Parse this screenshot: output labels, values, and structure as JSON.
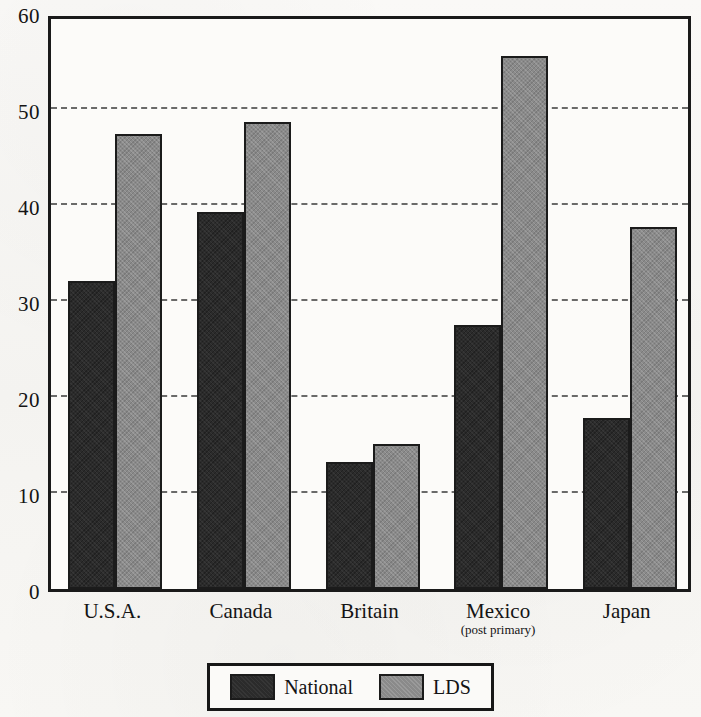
{
  "chart_data": {
    "type": "bar",
    "title": "",
    "subtitle": "",
    "xlabel": "",
    "ylabel": "",
    "categories": [
      "U.S.A.",
      "Canada",
      "Britain",
      "Mexico",
      "Japan"
    ],
    "category_sublabels": [
      "",
      "",
      "",
      "(post primary)",
      ""
    ],
    "series": [
      {
        "name": "National",
        "values": [
          32.1,
          39.3,
          13.2,
          27.5,
          17.8
        ],
        "color": "#2b2b2b"
      },
      {
        "name": "LDS",
        "values": [
          47.4,
          48.6,
          15.1,
          55.5,
          37.7
        ],
        "color": "#8a8a8a"
      }
    ],
    "ylim": [
      0,
      60
    ],
    "ytick_values": [
      0,
      10,
      20,
      30,
      40,
      50,
      60
    ],
    "ytick_labels": [
      "0",
      "10",
      "20",
      "30",
      "40",
      "50",
      "60"
    ],
    "grid": true,
    "grid_axis": "y",
    "legend_position": "bottom-center",
    "frame": true
  },
  "legend": {
    "entries": [
      {
        "label": "National",
        "swatch": "national"
      },
      {
        "label": "LDS",
        "swatch": "lds"
      }
    ]
  }
}
